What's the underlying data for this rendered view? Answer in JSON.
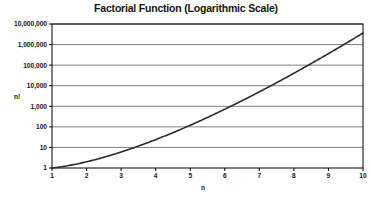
{
  "chart_data": {
    "type": "line",
    "title": "Factorial Function (Logarithmic Scale)",
    "xlabel": "n",
    "ylabel": "n!",
    "x": [
      1,
      2,
      3,
      4,
      5,
      6,
      7,
      8,
      9,
      10
    ],
    "values": [
      1,
      2,
      6,
      24,
      120,
      720,
      5040,
      40320,
      362880,
      3628800
    ],
    "series": [
      {
        "name": "n!",
        "values": [
          1,
          2,
          6,
          24,
          120,
          720,
          5040,
          40320,
          362880,
          3628800
        ]
      }
    ],
    "xlim": [
      1,
      10
    ],
    "ylim": [
      1,
      10000000
    ],
    "yscale": "log",
    "xscale": "linear",
    "grid": "horizontal",
    "legend": "none",
    "xticks": [
      "1",
      "2",
      "3",
      "4",
      "5",
      "6",
      "7",
      "8",
      "9",
      "10"
    ],
    "yticks": [
      "1",
      "10",
      "100",
      "1,000",
      "10,000",
      "100,000",
      "1,000,000",
      "10,000,000"
    ],
    "ytick_values": [
      1,
      10,
      100,
      1000,
      10000,
      100000,
      1000000,
      10000000
    ],
    "colors": {
      "line": "#2b2b2b",
      "grid": "#808080",
      "border": "#000000",
      "text": "#141414",
      "background": "#ffffff"
    }
  }
}
